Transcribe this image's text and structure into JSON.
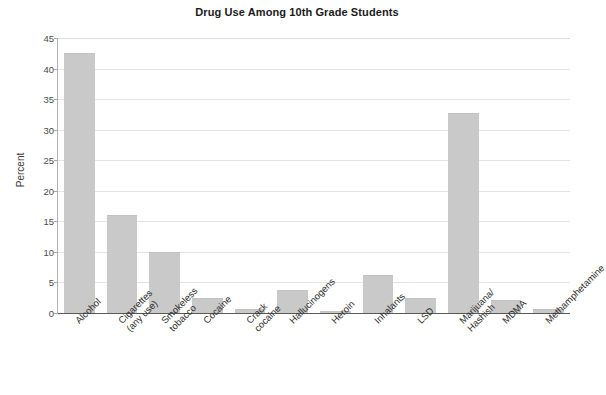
{
  "chart_data": {
    "type": "bar",
    "title": "Drug Use Among 10th Grade Students",
    "xlabel": "",
    "ylabel": "Percent",
    "ylim": [
      0,
      45
    ],
    "yticks": [
      0,
      5,
      10,
      15,
      20,
      25,
      30,
      35,
      40,
      45
    ],
    "grid": true,
    "legend": false,
    "bar_color": "#c9c9c9",
    "categories": [
      "Alcohol",
      "Cigarettes\n(any use)",
      "Smokeless\ntobacco",
      "Cocaine",
      "Crack\ncocaine",
      "Hallucinogens",
      "Heroin",
      "Inhalants",
      "LSD",
      "Marijuana/\nHashish",
      "MDMA",
      "Methamphetamine"
    ],
    "values": [
      42.5,
      16.0,
      10.0,
      2.4,
      0.7,
      3.7,
      0.3,
      6.3,
      2.5,
      32.8,
      2.2,
      0.6
    ]
  }
}
